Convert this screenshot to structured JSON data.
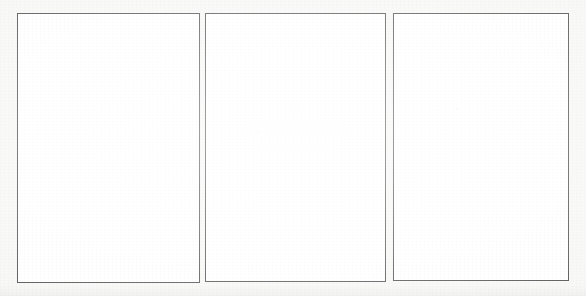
{
  "canvas": {
    "width": 586,
    "height": 296,
    "background_color": "#f7f7f6",
    "description": "Scanned sheet with three empty rectangular frames"
  },
  "style": {
    "panel_fill": "#ffffff",
    "panel_border_color": "#4a4a4c",
    "panel_border_width_px": 1.5
  },
  "panels": [
    {
      "id": "panel-1",
      "label": "",
      "content": "",
      "x": 17,
      "y": 13,
      "width": 183,
      "height": 270,
      "border_width_px": 1.5,
      "fill": "#ffffff",
      "border_color": "#4a4a4c"
    },
    {
      "id": "panel-2",
      "label": "",
      "content": "",
      "x": 205,
      "y": 13,
      "width": 181,
      "height": 269,
      "border_width_px": 1.5,
      "fill": "#ffffff",
      "border_color": "#4a4a4c"
    },
    {
      "id": "panel-3",
      "label": "",
      "content": "",
      "x": 393,
      "y": 13,
      "width": 176,
      "height": 268,
      "border_width_px": 1.5,
      "fill": "#ffffff",
      "border_color": "#4a4a4c"
    }
  ],
  "specks": [
    {
      "x": 258,
      "y": 131,
      "size": 2
    },
    {
      "x": 456,
      "y": 108,
      "size": 2
    }
  ]
}
